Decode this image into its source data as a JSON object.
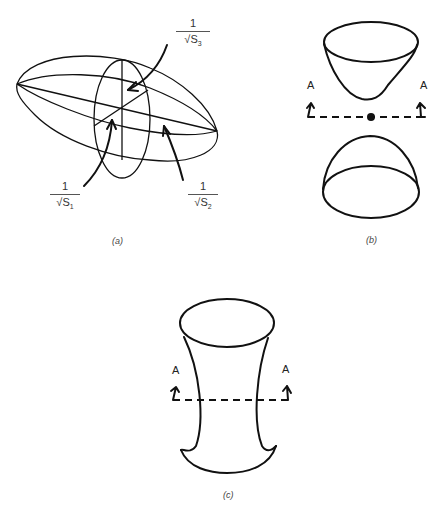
{
  "panels": {
    "a": {
      "caption": "(a)",
      "description": "Ellipsoid with three principal axes",
      "labels": [
        {
          "id": "s3",
          "numerator": "1",
          "radical": "√S",
          "subscript": "3"
        },
        {
          "id": "s1",
          "numerator": "1",
          "radical": "√S",
          "subscript": "1"
        },
        {
          "id": "s2",
          "numerator": "1",
          "radical": "√S",
          "subscript": "2"
        }
      ]
    },
    "b": {
      "caption": "(b)",
      "description": "Hyperboloid of two sheets with section plane A-A",
      "section_label_left": "A",
      "section_label_right": "A"
    },
    "c": {
      "caption": "(c)",
      "description": "Hyperboloid of one sheet with section plane A-A",
      "section_label_left": "A",
      "section_label_right": "A"
    }
  }
}
